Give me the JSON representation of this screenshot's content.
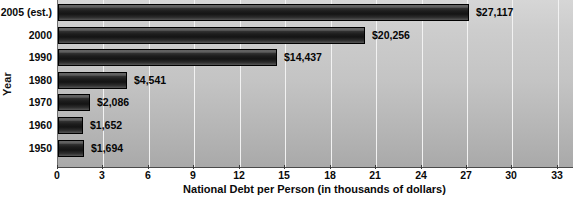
{
  "chart_data": {
    "type": "bar",
    "orientation": "horizontal",
    "title": "",
    "xlabel": "National Debt per Person (in thousands of dollars)",
    "ylabel": "Year",
    "categories": [
      "2005 (est.)",
      "2000",
      "1990",
      "1980",
      "1970",
      "1960",
      "1950"
    ],
    "values": [
      27.117,
      20.256,
      14.437,
      4.541,
      2.086,
      1.652,
      1.694
    ],
    "data_labels": [
      "$27,117",
      "$20,256",
      "$14,437",
      "$4,541",
      "$2,086",
      "$1,652",
      "$1,694"
    ],
    "xlim": [
      0,
      34
    ],
    "x_ticks": [
      0,
      3,
      6,
      9,
      12,
      15,
      18,
      21,
      24,
      27,
      30,
      33
    ],
    "x_tick_labels": [
      "0",
      "3",
      "6",
      "9",
      "12",
      "15",
      "18",
      "21",
      "24",
      "27",
      "30",
      "33"
    ],
    "grid": "vertical",
    "legend": "none",
    "bar_color": "#1d1d1d",
    "plot_background": "#c4c4c4",
    "gridline_color": "#f2f2f2"
  },
  "source_note": ""
}
